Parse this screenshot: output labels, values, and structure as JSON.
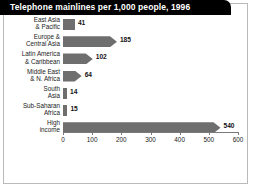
{
  "title": "Telephone mainlines per 1,000  people, 1996",
  "colors": {
    "bar": "#6e6e6e",
    "title_bar": "#000000",
    "title_text": "#ffffff",
    "frame": "#b9b9b9",
    "axis": "#7a7a7a",
    "background": "#ffffff"
  },
  "chart_data": {
    "type": "bar",
    "orientation": "horizontal",
    "title": "Telephone mainlines per 1,000  people, 1996",
    "xlabel": "",
    "ylabel": "",
    "xlim": [
      0,
      600
    ],
    "grid": false,
    "legend": null,
    "categories": [
      "East Asia & Pacific",
      "Europe & Central Asia",
      "Latin America & Caribbean",
      "Middle East & N. Africa",
      "South Asia",
      "Sub-Saharan Africa",
      "High income"
    ],
    "category_lines": [
      [
        "East Asia",
        "& Pacific"
      ],
      [
        "Europe &",
        "Central Asia"
      ],
      [
        "Latin America",
        "& Caribbean"
      ],
      [
        "Middle East",
        "& N. Africa"
      ],
      [
        "South",
        "Asia"
      ],
      [
        "Sub-Saharan",
        "Africa"
      ],
      [
        "High",
        "income"
      ]
    ],
    "values": [
      41,
      185,
      102,
      64,
      14,
      15,
      540
    ],
    "value_labels": [
      "41",
      "185",
      "102",
      "64",
      "14",
      "15",
      "540"
    ],
    "xticks": [
      0,
      100,
      200,
      300,
      400,
      500,
      600
    ],
    "xtick_labels": [
      "0",
      "100",
      "200",
      "300",
      "400",
      "500",
      "600"
    ]
  }
}
